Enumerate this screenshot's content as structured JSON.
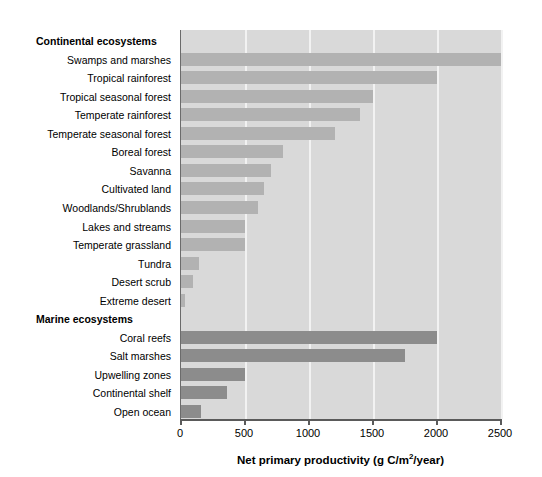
{
  "chart_data": {
    "type": "bar",
    "orientation": "horizontal",
    "title": "",
    "xlabel": "Net primary productivity (g C/m2/year)",
    "xlabel_prefix": "Net primary productivity (g C/m",
    "xlabel_sup": "2",
    "xlabel_suffix": "/year)",
    "ylabel": "",
    "xlim": [
      0,
      2500
    ],
    "xticks": [
      0,
      500,
      1000,
      1500,
      2000,
      2500
    ],
    "xticklabels": [
      "0",
      "500",
      "1000",
      "1500",
      "2000",
      "2500"
    ],
    "grid": true,
    "grid_axis": "x",
    "grid_color": "#f2f2f2",
    "plot_background": "#d9d9d9",
    "figure_background": "#ffffff",
    "legend": null,
    "groups": [
      {
        "name": "Continental ecosystems",
        "color": "#b2b2b2",
        "categories": [
          "Swamps and marshes",
          "Tropical rainforest",
          "Tropical seasonal forest",
          "Temperate rainforest",
          "Temperate seasonal forest",
          "Boreal forest",
          "Savanna",
          "Cultivated land",
          "Woodlands/Shrublands",
          "Lakes and streams",
          "Temperate grassland",
          "Tundra",
          "Desert scrub",
          "Extreme desert"
        ],
        "values": [
          2500,
          2000,
          1500,
          1400,
          1200,
          800,
          700,
          650,
          600,
          500,
          500,
          140,
          90,
          30
        ]
      },
      {
        "name": "Marine ecosystems",
        "color": "#8c8c8c",
        "categories": [
          "Coral reefs",
          "Salt marshes",
          "Upwelling zones",
          "Continental shelf",
          "Open ocean"
        ],
        "values": [
          2000,
          1750,
          500,
          360,
          160
        ]
      }
    ]
  },
  "rows": [
    {
      "label": "Continental ecosystems",
      "value": null,
      "group": true,
      "series": "continental"
    },
    {
      "label": "Swamps and marshes",
      "value": 2500,
      "group": false,
      "series": "continental"
    },
    {
      "label": "Tropical rainforest",
      "value": 2000,
      "group": false,
      "series": "continental"
    },
    {
      "label": "Tropical seasonal forest",
      "value": 1500,
      "group": false,
      "series": "continental"
    },
    {
      "label": "Temperate rainforest",
      "value": 1400,
      "group": false,
      "series": "continental"
    },
    {
      "label": "Temperate seasonal forest",
      "value": 1200,
      "group": false,
      "series": "continental"
    },
    {
      "label": "Boreal forest",
      "value": 800,
      "group": false,
      "series": "continental"
    },
    {
      "label": "Savanna",
      "value": 700,
      "group": false,
      "series": "continental"
    },
    {
      "label": "Cultivated land",
      "value": 650,
      "group": false,
      "series": "continental"
    },
    {
      "label": "Woodlands/Shrublands",
      "value": 600,
      "group": false,
      "series": "continental"
    },
    {
      "label": "Lakes and streams",
      "value": 500,
      "group": false,
      "series": "continental"
    },
    {
      "label": "Temperate grassland",
      "value": 500,
      "group": false,
      "series": "continental"
    },
    {
      "label": "Tundra",
      "value": 140,
      "group": false,
      "series": "continental"
    },
    {
      "label": "Desert scrub",
      "value": 90,
      "group": false,
      "series": "continental"
    },
    {
      "label": "Extreme desert",
      "value": 30,
      "group": false,
      "series": "continental"
    },
    {
      "label": "Marine ecosystems",
      "value": null,
      "group": true,
      "series": "marine"
    },
    {
      "label": "Coral reefs",
      "value": 2000,
      "group": false,
      "series": "marine"
    },
    {
      "label": "Salt marshes",
      "value": 1750,
      "group": false,
      "series": "marine"
    },
    {
      "label": "Upwelling zones",
      "value": 500,
      "group": false,
      "series": "marine"
    },
    {
      "label": "Continental shelf",
      "value": 360,
      "group": false,
      "series": "marine"
    },
    {
      "label": "Open ocean",
      "value": 160,
      "group": false,
      "series": "marine"
    }
  ]
}
